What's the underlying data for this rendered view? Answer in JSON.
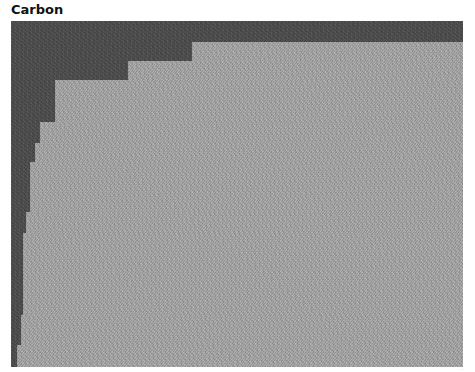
{
  "title": "Carbon",
  "figure": {
    "colors": {
      "dark": "#4b4b4b",
      "light": "#a7a7a7",
      "background": "#ffffff"
    },
    "steps": [
      {
        "x_from": 181,
        "y_from": 21
      },
      {
        "x_from": 117,
        "y_from": 40
      },
      {
        "x_from": 44,
        "y_from": 59
      },
      {
        "x_from": 29,
        "y_from": 101
      },
      {
        "x_from": 24,
        "y_from": 122
      },
      {
        "x_from": 19,
        "y_from": 141
      },
      {
        "x_from": 15,
        "y_from": 191
      },
      {
        "x_from": 12,
        "y_from": 212
      },
      {
        "x_from": 10,
        "y_from": 294
      },
      {
        "x_from": 6,
        "y_from": 324
      }
    ]
  },
  "watermark": "· ·· ·"
}
